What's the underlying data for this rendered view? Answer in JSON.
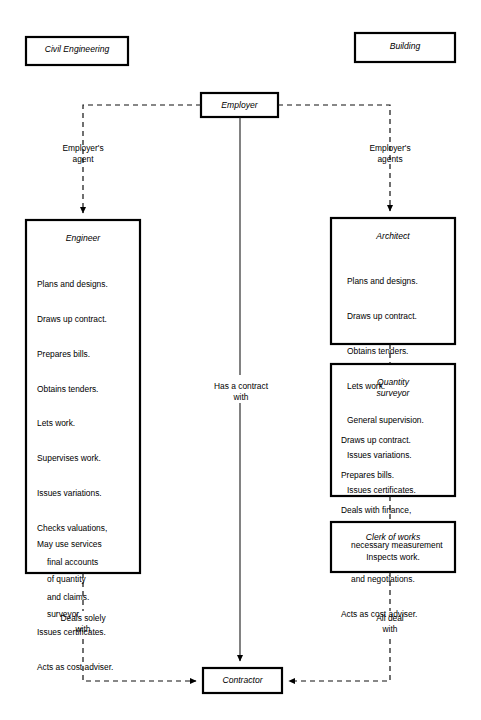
{
  "diagram": {
    "columns": {
      "left": {
        "label": "Civil Engineering"
      },
      "right": {
        "label": "Building"
      }
    },
    "nodes": {
      "employer": {
        "label": "Employer"
      },
      "engineer": {
        "title": "Engineer",
        "duties": [
          "Plans and designs.",
          "Draws up contract.",
          "Prepares bills.",
          "Obtains tenders.",
          "Lets work.",
          "Supervises work.",
          "Issues variations.",
          "Checks valuations,",
          "final accounts",
          "and claims.",
          "Issues certificates.",
          "Acts as cost adviser."
        ],
        "footer": [
          "May use services",
          "of quantity",
          "surveyor."
        ]
      },
      "architect": {
        "title": "Architect",
        "duties": [
          "Plans and designs.",
          "Draws up contract.",
          "Obtains tenders.",
          "Lets work.",
          "General supervision.",
          "Issues variations.",
          "Issues certificates."
        ]
      },
      "quantity_surveyor": {
        "title_line1": "Quantity",
        "title_line2": "surveyor",
        "duties": [
          "Draws up contract.",
          "Prepares bills.",
          "Deals with finance,",
          "necessary measurement",
          "and negotiations.",
          "Acts as cost adviser."
        ]
      },
      "clerk_of_works": {
        "title": "Clerk of works",
        "duties": [
          "Inspects work."
        ]
      },
      "contractor": {
        "label": "Contractor"
      }
    },
    "edge_labels": {
      "employer_agent_left_line1": "Employer's",
      "employer_agent_left_line2": "agent",
      "employer_agents_right_line1": "Employer's",
      "employer_agents_right_line2": "agents",
      "has_contract_line1": "Has a contract",
      "has_contract_line2": "with",
      "deals_solely_line1": "Deals solely",
      "deals_solely_line2": "with",
      "all_deal_line1": "All deal",
      "all_deal_line2": "with"
    },
    "colors": {
      "stroke": "#000000",
      "background": "#ffffff",
      "text": "#000000"
    }
  }
}
